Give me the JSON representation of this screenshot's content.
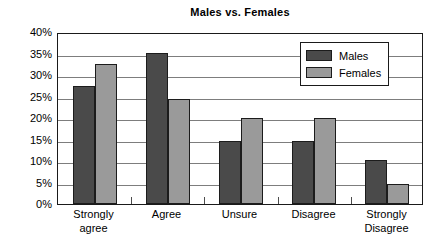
{
  "chart_data": {
    "type": "bar",
    "title": "Males vs. Females",
    "xlabel": "",
    "ylabel": "",
    "ylim": [
      0,
      40
    ],
    "ytick_labels": [
      "40%",
      "35%",
      "30%",
      "25%",
      "20%",
      "15%",
      "10%",
      "5%",
      "0%"
    ],
    "ytick_values": [
      40,
      35,
      30,
      25,
      20,
      15,
      10,
      5,
      0
    ],
    "grid": true,
    "legend_position": "top-right-inside",
    "categories": [
      "Strongly agree",
      "Agree",
      "Unsure",
      "Disagree",
      "Strongly Disagree"
    ],
    "category_lines": [
      [
        "Strongly",
        "agree"
      ],
      [
        "Agree"
      ],
      [
        "Unsure"
      ],
      [
        "Disagree"
      ],
      [
        "Strongly",
        "Disagree"
      ]
    ],
    "series": [
      {
        "name": "Males",
        "color": "#4a4a4a",
        "values": [
          27.5,
          35.0,
          14.7,
          14.7,
          10.3
        ]
      },
      {
        "name": "Females",
        "color": "#9a9a9a",
        "values": [
          32.5,
          24.5,
          20.0,
          20.0,
          4.6
        ]
      }
    ]
  },
  "legend": {
    "items": [
      {
        "label": "Males"
      },
      {
        "label": "Females"
      }
    ]
  },
  "colors": {
    "males": "#4a4a4a",
    "females": "#9a9a9a",
    "axis": "#1a1a1a",
    "gridline": "#7d7d7d",
    "background": "#ffffff"
  }
}
